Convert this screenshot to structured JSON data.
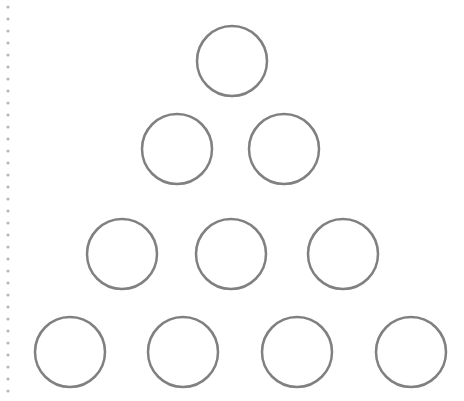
{
  "diagram": {
    "type": "triangular circle arrangement",
    "rows": [
      1,
      2,
      3,
      4
    ],
    "circle_stroke": "#808080",
    "circle_fill": "#ffffff",
    "circle_radius": 35,
    "stroke_width": 2.5,
    "circles": [
      {
        "row": 1,
        "cx": 232,
        "cy": 61
      },
      {
        "row": 2,
        "cx": 177,
        "cy": 149
      },
      {
        "row": 2,
        "cx": 284,
        "cy": 149
      },
      {
        "row": 3,
        "cx": 122,
        "cy": 254
      },
      {
        "row": 3,
        "cx": 231,
        "cy": 254
      },
      {
        "row": 3,
        "cx": 343,
        "cy": 254
      },
      {
        "row": 4,
        "cx": 70,
        "cy": 352
      },
      {
        "row": 4,
        "cx": 183,
        "cy": 352
      },
      {
        "row": 4,
        "cx": 297,
        "cy": 352
      },
      {
        "row": 4,
        "cx": 411,
        "cy": 352
      }
    ],
    "margin_line": {
      "x": 8,
      "y_start": 7,
      "y_end": 395,
      "dot_spacing": 12,
      "color": "#b8b8b8"
    }
  }
}
